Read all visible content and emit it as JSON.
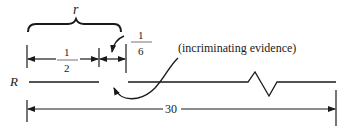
{
  "diagram": {
    "brace_label": "r",
    "half_label": {
      "numerator": "1",
      "denominator": "2"
    },
    "sixth_label": {
      "numerator": "1",
      "denominator": "6"
    },
    "annotation": "(incriminating evidence)",
    "row_label": "R",
    "total_label": "30",
    "line_color": "#1a1a1a"
  }
}
